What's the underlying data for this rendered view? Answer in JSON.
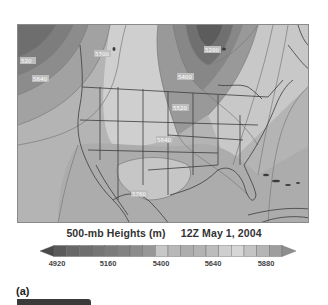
{
  "figure": {
    "title_variable": "500-mb Heights (m)",
    "title_time": "12Z  May 1, 2004",
    "panel_label": "(a)"
  },
  "map": {
    "region": "North America",
    "contour_labels": [
      {
        "text": "520",
        "x": 4,
        "y": 37
      },
      {
        "text": "5640",
        "x": 16,
        "y": 55
      },
      {
        "text": "5700",
        "x": 78,
        "y": 30
      },
      {
        "text": "5280",
        "x": 188,
        "y": 26
      },
      {
        "text": "5400",
        "x": 161,
        "y": 53
      },
      {
        "text": "5520",
        "x": 156,
        "y": 84
      },
      {
        "text": "5640",
        "x": 140,
        "y": 116
      },
      {
        "text": "5760",
        "x": 115,
        "y": 170
      }
    ]
  },
  "colorbar": {
    "tick_labels": [
      "4920",
      "5160",
      "5400",
      "5640",
      "5880"
    ],
    "colors": [
      "#5a5a5a",
      "#676767",
      "#6f6f6f",
      "#757575",
      "#7b7b7b",
      "#828282",
      "#8c8c8c",
      "#979797",
      "#c7c7c7",
      "#b8b8b8",
      "#adadad",
      "#b3b3b3",
      "#bcbcbc",
      "#cfcfcf",
      "#d6d6d6",
      "#c4c4c4",
      "#b5b5b5",
      "#9e9e9e"
    ],
    "min_arrow_color": "#4a4a4a",
    "max_arrow_color": "#8e8e8e"
  },
  "chart_data": {
    "type": "heatmap",
    "title": "500-mb Heights (m)   12Z May 1, 2004",
    "variable": "500-mb geopotential height",
    "units": "m",
    "colorbar_ticks": [
      4920,
      5160,
      5400,
      5640,
      5880
    ],
    "colorbar_range": [
      4920,
      5880
    ],
    "contour_labels": [
      5520,
      5640,
      5700,
      5280,
      5400,
      5520,
      5640,
      5760
    ],
    "panel": "(a)"
  }
}
